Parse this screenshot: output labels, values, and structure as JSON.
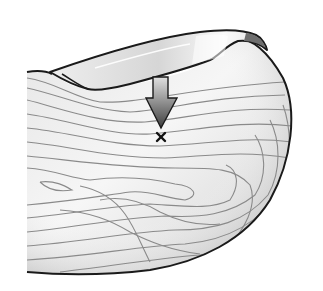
{
  "figure": {
    "colors": {
      "background": "#ffffff",
      "outline": "#1a1a1a",
      "skin_light": "#f4f4f4",
      "skin_shade": "#bdbdbd",
      "ridge_line": "#8a8a8a",
      "nail_light": "#f7f7f7",
      "nail_shade": "#cfcfcf",
      "nail_edge_dark": "#6e6e6e",
      "arrow_top": "#d9d9d9",
      "arrow_bottom": "#4a4a4a",
      "marker": "#111111"
    },
    "marker": {
      "symbol": "×",
      "x": 161,
      "y": 137
    },
    "arrow": {
      "direction": "down",
      "tip_x": 161,
      "tip_y": 128
    }
  }
}
